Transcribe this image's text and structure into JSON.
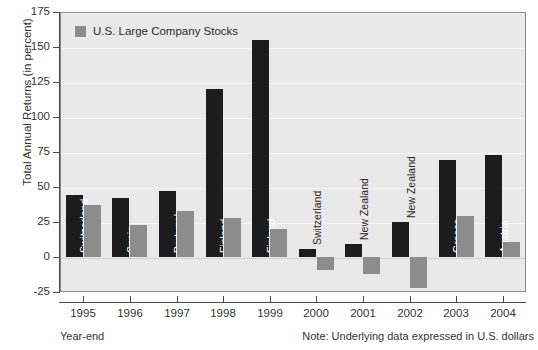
{
  "chart_data": {
    "type": "bar",
    "title": "",
    "xlabel": "Year-end",
    "ylabel": "Total Annual Returns (in percent)",
    "ylim": [
      -25,
      175
    ],
    "yticks": [
      175,
      150,
      125,
      100,
      75,
      50,
      25,
      0,
      -25
    ],
    "grid": true,
    "legend_position": "top-left",
    "categories": [
      "1995",
      "1996",
      "1997",
      "1998",
      "1999",
      "2000",
      "2001",
      "2002",
      "2003",
      "2004"
    ],
    "point_labels": [
      "Switzerland",
      "Spain",
      "Portugal",
      "Finland",
      "Finland",
      "Switzerland",
      "New Zealand",
      "New Zealand",
      "Greece",
      "Austria"
    ],
    "series": [
      {
        "name": "Best Performing Country",
        "color": "#1c1c1c",
        "values": [
          44,
          42,
          47,
          120,
          155,
          6,
          9,
          25,
          69,
          73
        ]
      },
      {
        "name": "U.S. Large Company Stocks",
        "color": "#8c8c8c",
        "values": [
          37,
          23,
          33,
          28,
          20,
          -9,
          -12,
          -22,
          29,
          11
        ]
      }
    ],
    "note": "Note: Underlying data expressed in U.S. dollars"
  },
  "legend": {
    "entries": [
      {
        "label": "U.S. Large Company Stocks",
        "color": "#8c8c8c"
      }
    ]
  },
  "axes": {
    "y_title": "Total Annual Returns (in percent)",
    "x_title": "Year-end",
    "y_tick_labels": [
      "175",
      "150",
      "125",
      "100",
      "75",
      "50",
      "25",
      "0",
      "-25"
    ],
    "x_tick_labels": [
      "1995",
      "1996",
      "1997",
      "1998",
      "1999",
      "2000",
      "2001",
      "2002",
      "2003",
      "2004"
    ]
  },
  "footer": {
    "left": "Year-end",
    "right": "Note: Underlying data expressed in U.S. dollars"
  }
}
